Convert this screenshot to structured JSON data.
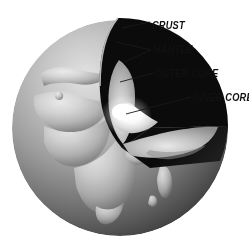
{
  "figure": {
    "background_color": "#ffffff"
  },
  "labels": {
    "crust": "CRUST",
    "mantle": "MANTLE",
    "outer_core": "OUTER CORE",
    "inner_core": "INNER CORE"
  },
  "palette": {
    "label_text": "#111111",
    "leader_line": "#1a1a1a",
    "globe_light": "#cfcfcf",
    "globe_mid": "#9a9a9a",
    "globe_dark": "#3a3a3a",
    "land": "#d6d6d6",
    "mantle_black": "#080808",
    "outer_core_gray": "#b9b9b9",
    "inner_core_white": "#ffffff"
  },
  "geometry": {
    "globe_center_x": 120,
    "globe_center_y": 128,
    "globe_radius": 108
  }
}
